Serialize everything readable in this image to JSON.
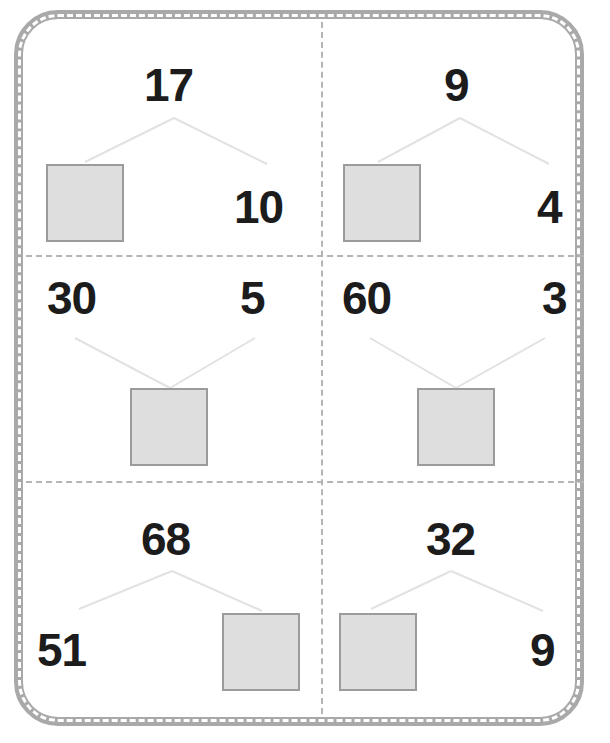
{
  "worksheet": {
    "title": "Number Bond Worksheet",
    "frame_color": "#a9a9a9",
    "divider_color": "#b4b4b4",
    "answer_box_fill": "#dedede",
    "answer_box_border": "#9b9b9b",
    "connector_color": "#e2e2e2",
    "number_color": "#1c1c1c",
    "rows": 3,
    "columns": 2
  },
  "problems": [
    {
      "id": "problem-1",
      "orientation": "top-whole",
      "whole": "17",
      "part_left": "",
      "part_right": "10",
      "blank_position": "part-left",
      "blank_label": "answer-box"
    },
    {
      "id": "problem-2",
      "orientation": "top-whole",
      "whole": "9",
      "part_left": "",
      "part_right": "4",
      "blank_position": "part-left",
      "blank_label": "answer-box"
    },
    {
      "id": "problem-3",
      "orientation": "bottom-whole",
      "whole": "",
      "part_left": "30",
      "part_right": "5",
      "blank_position": "whole",
      "blank_label": "answer-box"
    },
    {
      "id": "problem-4",
      "orientation": "bottom-whole",
      "whole": "",
      "part_left": "60",
      "part_right": "3",
      "blank_position": "whole",
      "blank_label": "answer-box"
    },
    {
      "id": "problem-5",
      "orientation": "top-whole",
      "whole": "68",
      "part_left": "51",
      "part_right": "",
      "blank_position": "part-right",
      "blank_label": "answer-box"
    },
    {
      "id": "problem-6",
      "orientation": "top-whole",
      "whole": "32",
      "part_left": "",
      "part_right": "9",
      "blank_position": "part-left",
      "blank_label": "answer-box"
    }
  ]
}
